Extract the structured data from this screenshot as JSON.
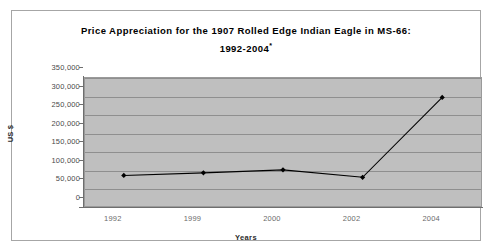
{
  "chart_data": {
    "type": "line",
    "title": "Price Appreciation for the 1907 Rolled Edge Indian Eagle in MS-66:",
    "subtitle": "1992-2004*",
    "title_line1": "Price Appreciation for the 1907 Rolled Edge Indian Eagle in MS-66:",
    "title_line2": "1992-2004",
    "title_footnote_marker": "*",
    "xlabel": "Years",
    "ylabel": "US $",
    "categories": [
      "1992",
      "1999",
      "2000",
      "2002",
      "2004"
    ],
    "values": [
      85000,
      92000,
      100000,
      80000,
      295000
    ],
    "series": [
      {
        "name": "Price",
        "values": [
          85000,
          92000,
          100000,
          80000,
          295000
        ]
      }
    ],
    "ylim": [
      0,
      350000
    ],
    "ytick_values": [
      0,
      50000,
      100000,
      150000,
      200000,
      250000,
      300000,
      350000
    ],
    "ytick_labels": [
      "0",
      "50,000",
      "100,000",
      "150,000",
      "200,000",
      "250,000",
      "300,000",
      "350,000"
    ],
    "grid": true,
    "grid_axis": "y",
    "legend": false,
    "legend_position": "none",
    "marker": "diamond",
    "colors": {
      "line": "#000000",
      "marker": "#000000",
      "plot_background": "#bfbfbf",
      "gridline": "#8f8f8f",
      "axis": "#6e6e6e",
      "frame_border": "#a6a6a6",
      "page_background": "#ffffff",
      "title_text": "#000000",
      "tick_text": "#5a5a5a"
    }
  }
}
